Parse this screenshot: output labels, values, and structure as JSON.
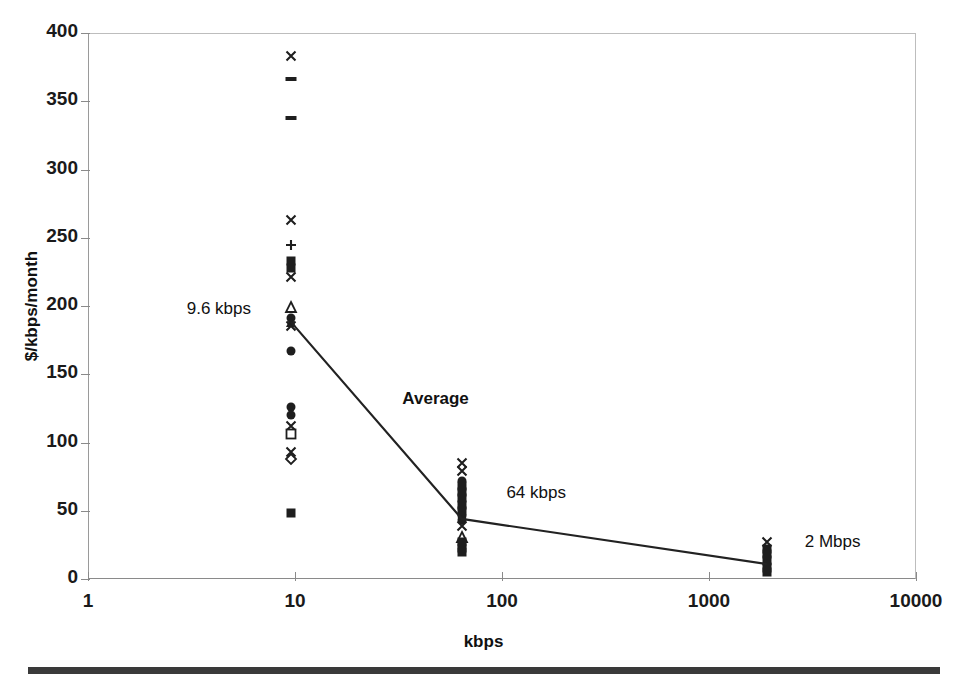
{
  "chart_data": {
    "type": "scatter",
    "title": "",
    "xlabel": "kbps",
    "ylabel": "$/kbps/month",
    "xscale": "log",
    "xlim": [
      1,
      10000
    ],
    "ylim": [
      0,
      400
    ],
    "grid": false,
    "legend": "none",
    "xticks": [
      "1",
      "10",
      "100",
      "1000",
      "10000"
    ],
    "xtick_values": [
      1,
      10,
      100,
      1000,
      10000
    ],
    "yticks": [
      "0",
      "50",
      "100",
      "150",
      "200",
      "250",
      "300",
      "350",
      "400"
    ],
    "ytick_values": [
      0,
      50,
      100,
      150,
      200,
      250,
      300,
      350,
      400
    ],
    "annotations": [
      {
        "text": "9.6 kbps",
        "x": 3.0,
        "y": 198,
        "bold": false
      },
      {
        "text": "Average",
        "x": 33,
        "y": 132,
        "bold": true
      },
      {
        "text": "64 kbps",
        "x": 105,
        "y": 63,
        "bold": false
      },
      {
        "text": "2 Mbps",
        "x": 2900,
        "y": 27,
        "bold": false
      }
    ],
    "series": [
      {
        "name": "9.6 kbps tariffs",
        "x": 9.6,
        "marker_points": [
          {
            "y": 383,
            "marker": "x"
          },
          {
            "y": 366,
            "marker": "dash"
          },
          {
            "y": 338,
            "marker": "dash"
          },
          {
            "y": 263,
            "marker": "x"
          },
          {
            "y": 245,
            "marker": "plus"
          },
          {
            "y": 233,
            "marker": "filled-square"
          },
          {
            "y": 228,
            "marker": "filled-square"
          },
          {
            "y": 221,
            "marker": "x"
          },
          {
            "y": 199,
            "marker": "open-triangle"
          },
          {
            "y": 191,
            "marker": "filled-circle"
          },
          {
            "y": 188,
            "marker": "filled-triangle"
          },
          {
            "y": 185,
            "marker": "x"
          },
          {
            "y": 167,
            "marker": "filled-circle"
          },
          {
            "y": 126,
            "marker": "filled-circle"
          },
          {
            "y": 120,
            "marker": "filled-circle"
          },
          {
            "y": 112,
            "marker": "x"
          },
          {
            "y": 106,
            "marker": "open-square"
          },
          {
            "y": 93,
            "marker": "x"
          },
          {
            "y": 88,
            "marker": "open-diamond"
          },
          {
            "y": 48,
            "marker": "filled-square"
          }
        ]
      },
      {
        "name": "64 kbps tariffs",
        "x": 64,
        "marker_points": [
          {
            "y": 85,
            "marker": "x"
          },
          {
            "y": 79,
            "marker": "x"
          },
          {
            "y": 72,
            "marker": "filled-circle"
          },
          {
            "y": 68,
            "marker": "filled-square"
          },
          {
            "y": 64,
            "marker": "filled-square"
          },
          {
            "y": 59,
            "marker": "filled-square"
          },
          {
            "y": 54,
            "marker": "filled-square"
          },
          {
            "y": 50,
            "marker": "filled-square"
          },
          {
            "y": 46,
            "marker": "filled-circle"
          },
          {
            "y": 43,
            "marker": "filled-circle"
          },
          {
            "y": 39,
            "marker": "x"
          },
          {
            "y": 31,
            "marker": "open-triangle"
          },
          {
            "y": 27,
            "marker": "filled-square"
          },
          {
            "y": 23,
            "marker": "filled-square"
          },
          {
            "y": 20,
            "marker": "filled-square"
          }
        ]
      },
      {
        "name": "2 Mbps tariffs",
        "x": 1900,
        "marker_points": [
          {
            "y": 27,
            "marker": "x"
          },
          {
            "y": 22,
            "marker": "filled-square"
          },
          {
            "y": 18,
            "marker": "filled-square"
          },
          {
            "y": 14,
            "marker": "filled-square"
          },
          {
            "y": 11,
            "marker": "filled-circle"
          },
          {
            "y": 8,
            "marker": "filled-square"
          },
          {
            "y": 5,
            "marker": "filled-square"
          }
        ]
      }
    ],
    "average_line": {
      "name": "Average",
      "x": [
        9.6,
        64,
        1900
      ],
      "y": [
        188,
        44,
        11
      ]
    }
  },
  "footer": {
    "rule": "horizontal-rule"
  }
}
